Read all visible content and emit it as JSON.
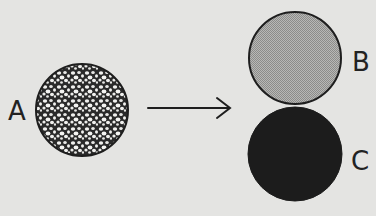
{
  "diagram": {
    "type": "process-illustration",
    "labels": {
      "a": "A",
      "b": "B",
      "c": "C"
    },
    "elements": {
      "circle_a": {
        "label": "A",
        "fill": "bubbly-textured",
        "description": "circle filled with many small bubbles/cells"
      },
      "arrow": {
        "direction": "right",
        "from": "A",
        "to": "B/C"
      },
      "circle_b": {
        "label": "B",
        "fill": "light-gray-stipple",
        "color": "#a9a9a9"
      },
      "circle_c": {
        "label": "C",
        "fill": "solid-dark",
        "color": "#1c1c1c"
      }
    },
    "colors": {
      "background": "#e4e4e2",
      "outline": "#1e1e1e",
      "circle_b_fill": "#a9a9a9",
      "circle_c_fill": "#1c1c1c"
    }
  }
}
